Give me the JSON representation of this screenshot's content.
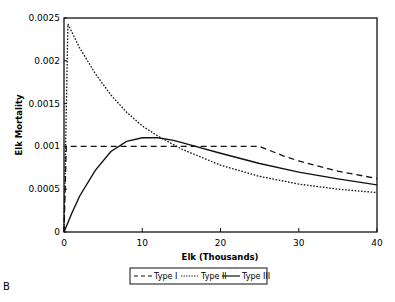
{
  "panel_label": "B",
  "chart_data": {
    "type": "line",
    "title": "",
    "xlabel": "Elk (Thousands)",
    "ylabel": "Elk Mortality",
    "xlim": [
      0,
      40
    ],
    "ylim": [
      0,
      0.0025
    ],
    "xticks": [
      "0",
      "10",
      "20",
      "30",
      "40"
    ],
    "yticks": [
      "0",
      "0.0005",
      "0.001",
      "0.0015",
      "0.002",
      "0.0025"
    ],
    "grid": false,
    "legend_position": "bottom",
    "series": [
      {
        "name": "Type I",
        "style": "dashed",
        "x": [
          0,
          0.3,
          5,
          10,
          15,
          20,
          25,
          28,
          30,
          35,
          40
        ],
        "y": [
          0,
          0.001,
          0.001,
          0.001,
          0.001,
          0.001,
          0.001,
          0.00089,
          0.00083,
          0.00071,
          0.000625
        ]
      },
      {
        "name": "Type II",
        "style": "dotted",
        "x": [
          0,
          0.5,
          2,
          4,
          6,
          8,
          10,
          12,
          15,
          20,
          25,
          30,
          35,
          40
        ],
        "y": [
          0,
          0.00243,
          0.00215,
          0.00185,
          0.0016,
          0.0014,
          0.00124,
          0.00112,
          0.00097,
          0.00078,
          0.00065,
          0.00056,
          0.0005,
          0.00046
        ]
      },
      {
        "name": "Type III",
        "style": "solid",
        "x": [
          0,
          1,
          2,
          4,
          6,
          8,
          10,
          12,
          14,
          16,
          20,
          25,
          30,
          35,
          40
        ],
        "y": [
          0,
          0.00022,
          0.00042,
          0.00072,
          0.00094,
          0.00106,
          0.0011,
          0.0011,
          0.00107,
          0.00102,
          0.00092,
          0.0008,
          0.0007,
          0.00062,
          0.00055
        ]
      }
    ]
  }
}
